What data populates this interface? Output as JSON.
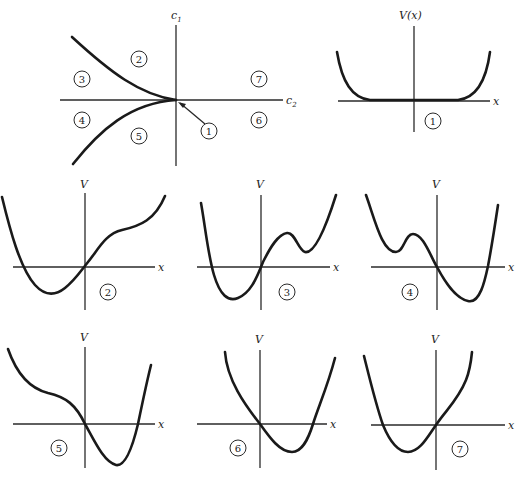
{
  "control_plane": {
    "vertical_axis_label": "c",
    "vertical_axis_subscript": "1",
    "horizontal_axis_label": "c",
    "horizontal_axis_subscript": "2",
    "regions": [
      {
        "id": "2",
        "label": "2"
      },
      {
        "id": "3",
        "label": "3"
      },
      {
        "id": "4",
        "label": "4"
      },
      {
        "id": "5",
        "label": "5"
      },
      {
        "id": "6",
        "label": "6"
      },
      {
        "id": "7",
        "label": "7"
      }
    ],
    "cusp_point_label": "1"
  },
  "potential_plots": [
    {
      "id": "1",
      "y_label": "V(x)",
      "x_label": "x",
      "badge": "1"
    },
    {
      "id": "2",
      "y_label": "V",
      "x_label": "x",
      "badge": "2"
    },
    {
      "id": "3",
      "y_label": "V",
      "x_label": "x",
      "badge": "3"
    },
    {
      "id": "4",
      "y_label": "V",
      "x_label": "x",
      "badge": "4"
    },
    {
      "id": "5",
      "y_label": "V",
      "x_label": "x",
      "badge": "5"
    },
    {
      "id": "6",
      "y_label": "V",
      "x_label": "x",
      "badge": "6"
    },
    {
      "id": "7",
      "y_label": "V",
      "x_label": "x",
      "badge": "7"
    }
  ],
  "colors": {
    "ink": "#1a1a1a",
    "background": "#ffffff"
  }
}
